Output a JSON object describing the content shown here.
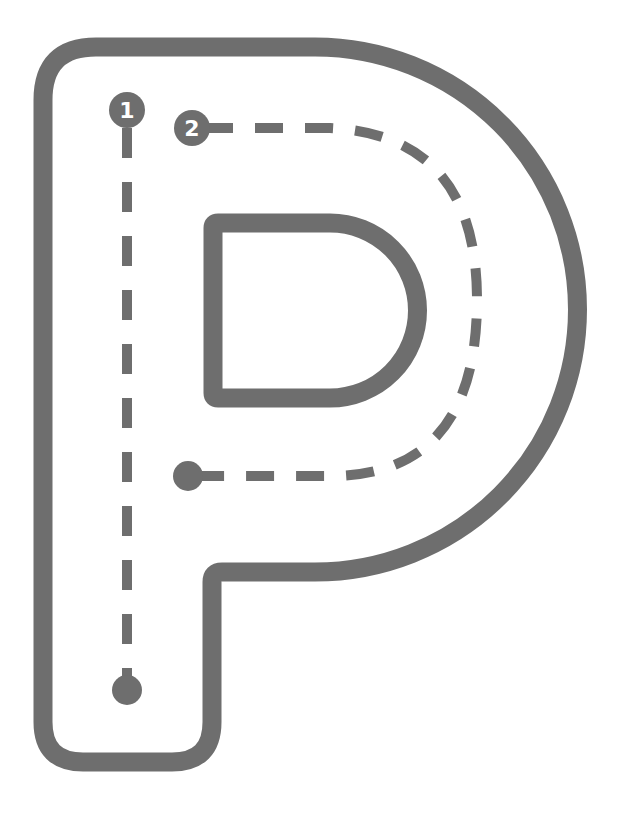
{
  "worksheet": {
    "letter": "P",
    "type": "letter tracing",
    "stroke_color": "#6e6e6e",
    "background": "#ffffff",
    "steps": [
      {
        "number": "1",
        "label": "1",
        "direction": "vertical stroke down the stem"
      },
      {
        "number": "2",
        "label": "2",
        "direction": "curved stroke around the bowl"
      }
    ]
  }
}
